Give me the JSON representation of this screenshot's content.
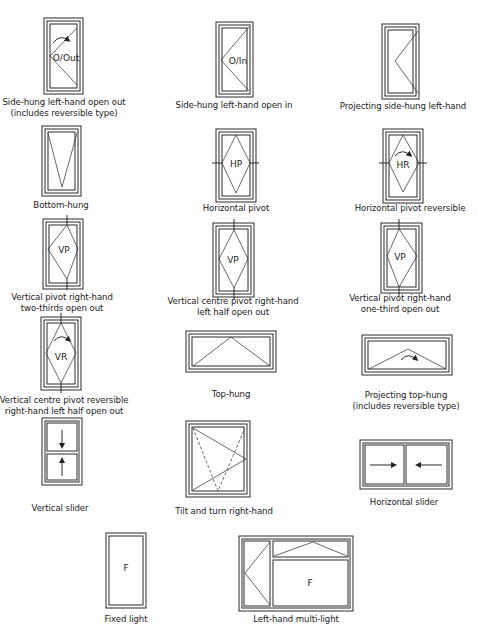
{
  "colors": {
    "line": "#2a2a2a",
    "background": "#ffffff"
  },
  "windows": [
    {
      "id": "side-hung-lh-out",
      "label_line1": "Side-hung left-hand open out",
      "label_line2": "(includes reversible type)",
      "code": "O/Out"
    },
    {
      "id": "side-hung-lh-in",
      "label_line1": "Side-hung left-hand open in",
      "label_line2": "",
      "code": "O/In"
    },
    {
      "id": "projecting-side-hung-lh",
      "label_line1": "Projecting side-hung left-hand",
      "label_line2": "",
      "code": ""
    },
    {
      "id": "bottom-hung",
      "label_line1": "Bottom-hung",
      "label_line2": "",
      "code": ""
    },
    {
      "id": "horizontal-pivot",
      "label_line1": "Horizontal pivot",
      "label_line2": "",
      "code": "HP"
    },
    {
      "id": "horizontal-pivot-reversible",
      "label_line1": "Horizontal pivot reversible",
      "label_line2": "",
      "code": "HR"
    },
    {
      "id": "vertical-pivot-rh-two-thirds",
      "label_line1": "Vertical pivot right-hand",
      "label_line2": "two-thirds open out",
      "code": "VP"
    },
    {
      "id": "vertical-centre-pivot-rh",
      "label_line1": "Vertical centre pivot right-hand",
      "label_line2": "left half open out",
      "code": "VP"
    },
    {
      "id": "vertical-pivot-rh-one-third",
      "label_line1": "Vertical pivot right-hand",
      "label_line2": "one-third open out",
      "code": "VP"
    },
    {
      "id": "vertical-centre-pivot-reversible",
      "label_line1": "Vertical centre pivot reversible",
      "label_line2": "right-hand left half open out",
      "code": "VR"
    },
    {
      "id": "top-hung",
      "label_line1": "Top-hung",
      "label_line2": "",
      "code": ""
    },
    {
      "id": "projecting-top-hung",
      "label_line1": "Projecting top-hung",
      "label_line2": "(includes reversible type)",
      "code": ""
    },
    {
      "id": "vertical-slider",
      "label_line1": "Vertical slider",
      "label_line2": "",
      "code": ""
    },
    {
      "id": "tilt-and-turn-rh",
      "label_line1": "Tilt and turn right-hand",
      "label_line2": "",
      "code": ""
    },
    {
      "id": "horizontal-slider",
      "label_line1": "Horizontal slider",
      "label_line2": "",
      "code": ""
    },
    {
      "id": "fixed-light",
      "label_line1": "Fixed light",
      "label_line2": "",
      "code": "F"
    },
    {
      "id": "lh-multi-light",
      "label_line1": "Left-hand multi-light",
      "label_line2": "",
      "code": "F"
    }
  ]
}
